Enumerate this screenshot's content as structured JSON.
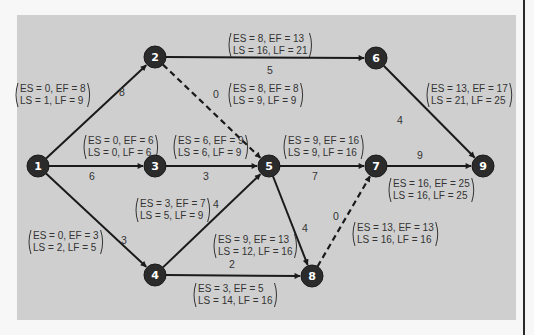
{
  "colors": {
    "panel": "#cfcfcf",
    "background": "#f7f7f7",
    "node_fill": "#2b2b2b",
    "node_text": "#ffffff",
    "edge": "#1a1a1a",
    "text": "#333333"
  },
  "nodes": [
    {
      "id": "1",
      "label": "1",
      "x": 38,
      "y": 166
    },
    {
      "id": "2",
      "label": "2",
      "x": 155,
      "y": 57
    },
    {
      "id": "3",
      "label": "3",
      "x": 155,
      "y": 166
    },
    {
      "id": "4",
      "label": "4",
      "x": 155,
      "y": 275
    },
    {
      "id": "5",
      "label": "5",
      "x": 269,
      "y": 166
    },
    {
      "id": "6",
      "label": "6",
      "x": 376,
      "y": 58
    },
    {
      "id": "7",
      "label": "7",
      "x": 376,
      "y": 166
    },
    {
      "id": "8",
      "label": "8",
      "x": 312,
      "y": 276
    },
    {
      "id": "9",
      "label": "9",
      "x": 483,
      "y": 166
    }
  ],
  "edges": [
    {
      "from": "1",
      "to": "2",
      "duration": "8",
      "dashed": false,
      "es_ef": "ES = 0, EF = 8",
      "ls_lf": "LS = 1, LF = 9"
    },
    {
      "from": "1",
      "to": "3",
      "duration": "6",
      "dashed": false,
      "es_ef": "ES = 0, EF = 6",
      "ls_lf": "LS = 0, LF = 6"
    },
    {
      "from": "1",
      "to": "4",
      "duration": "3",
      "dashed": false,
      "es_ef": "ES = 0, EF = 3",
      "ls_lf": "LS = 2, LF = 5"
    },
    {
      "from": "2",
      "to": "6",
      "duration": "5",
      "dashed": false,
      "es_ef": "ES = 8,   EF = 13",
      "ls_lf": "LS = 16, LF = 21"
    },
    {
      "from": "2",
      "to": "5",
      "duration": "0",
      "dashed": true,
      "es_ef": "ES = 8, EF = 8",
      "ls_lf": "LS = 9, LF = 9"
    },
    {
      "from": "3",
      "to": "5",
      "duration": "3",
      "dashed": false,
      "es_ef": "ES = 6, EF = 9",
      "ls_lf": "LS = 6, LF = 9"
    },
    {
      "from": "4",
      "to": "5",
      "duration": "4",
      "dashed": false,
      "es_ef": "ES = 3, EF = 7",
      "ls_lf": "LS = 5, LF = 9"
    },
    {
      "from": "4",
      "to": "8",
      "duration": "2",
      "dashed": false,
      "es_ef": "ES = 3,   EF = 5",
      "ls_lf": "LS = 14, LF = 16"
    },
    {
      "from": "5",
      "to": "7",
      "duration": "7",
      "dashed": false,
      "es_ef": "ES = 9, EF = 16",
      "ls_lf": "LS = 9, LF = 16"
    },
    {
      "from": "5",
      "to": "8",
      "duration": "4",
      "dashed": false,
      "es_ef": "ES = 9,   EF = 13",
      "ls_lf": "LS = 12, LF = 16"
    },
    {
      "from": "6",
      "to": "9",
      "duration": "4",
      "dashed": false,
      "es_ef": "ES = 13, EF = 17",
      "ls_lf": "LS = 21, LF = 25"
    },
    {
      "from": "7",
      "to": "9",
      "duration": "9",
      "dashed": false,
      "es_ef": "ES = 16, EF = 25",
      "ls_lf": "LS = 16, LF = 25"
    },
    {
      "from": "8",
      "to": "7",
      "duration": "0",
      "dashed": true,
      "es_ef": "ES = 13, EF = 13",
      "ls_lf": "LS = 16, LF = 16"
    }
  ]
}
